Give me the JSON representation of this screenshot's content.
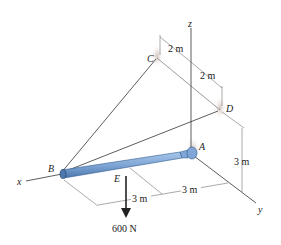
{
  "diagram": {
    "axes": {
      "x": "x",
      "y": "y",
      "z": "z"
    },
    "points": {
      "A": "A",
      "B": "B",
      "C": "C",
      "D": "D",
      "E": "E"
    },
    "dimensions": {
      "c_to_z": "2 m",
      "z_to_d": "2 m",
      "d_height": "3 m",
      "a_to_y_dim": "3 m",
      "e_dim": "3 m"
    },
    "load": {
      "label": "600 N"
    },
    "colors": {
      "rod": "#7fa6d6",
      "rod_edge": "#2f5a8f",
      "line": "#333333"
    }
  }
}
